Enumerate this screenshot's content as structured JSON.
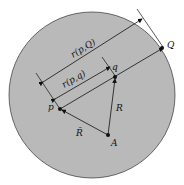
{
  "figure": {
    "labels": {
      "r_pQ": "r(p,Q)",
      "r_pq": "r(p,q)",
      "p": "p",
      "q": "q",
      "Q": "Q",
      "A": "A",
      "R": "R",
      "R_bar": "R̄"
    },
    "colors": {
      "disk_fill": "#b9b9b9",
      "line": "#111111",
      "background": "#ffffff"
    }
  }
}
